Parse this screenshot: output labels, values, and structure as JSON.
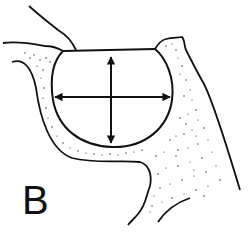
{
  "figure": {
    "panel_label": "B",
    "colors": {
      "line": "#111111",
      "background": "#ffffff",
      "stipple": "#222222"
    },
    "annotations": [
      {
        "type": "double-arrow",
        "orientation": "vertical",
        "meaning": "cavity depth"
      },
      {
        "type": "double-arrow",
        "orientation": "horizontal",
        "meaning": "cavity width"
      }
    ]
  }
}
